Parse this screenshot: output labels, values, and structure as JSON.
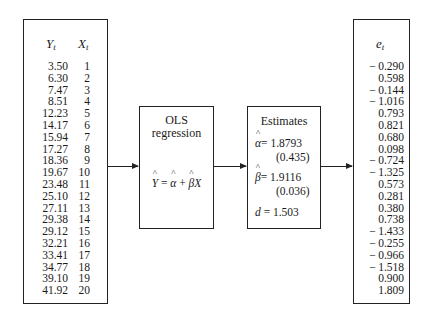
{
  "data_table": {
    "y_header": "Y",
    "y_sub": "t",
    "x_header": "X",
    "x_sub": "t",
    "Y": [
      "3.50",
      "6.30",
      "7.47",
      "8.51",
      "12.23",
      "14.17",
      "15.94",
      "17.27",
      "18.36",
      "19.67",
      "23.48",
      "25.10",
      "27.11",
      "29.38",
      "29.12",
      "32.21",
      "33.41",
      "34.77",
      "39.10",
      "41.92"
    ],
    "X": [
      "1",
      "2",
      "3",
      "4",
      "5",
      "6",
      "7",
      "8",
      "9",
      "10",
      "11",
      "12",
      "13",
      "14",
      "15",
      "16",
      "17",
      "18",
      "19",
      "20"
    ]
  },
  "ols_box": {
    "title_line1": "OLS",
    "title_line2": "regression",
    "equation": {
      "lhs": "Y",
      "eq": " = ",
      "alpha": "α",
      "plus": " + ",
      "beta": "β",
      "x": "X"
    }
  },
  "estimates_box": {
    "title": "Estimates",
    "alpha_symbol": "α",
    "alpha_value": "= 1.8793",
    "alpha_se": "(0.435)",
    "beta_symbol": "β",
    "beta_value": "= 1.9116",
    "beta_se": "(0.036)",
    "d_symbol": "d",
    "d_value": " = 1.503"
  },
  "residuals": {
    "header": "e",
    "sub": "t",
    "values": [
      {
        "neg": true,
        "v": "0.290"
      },
      {
        "neg": false,
        "v": "0.598"
      },
      {
        "neg": true,
        "v": "0.144"
      },
      {
        "neg": true,
        "v": "1.016"
      },
      {
        "neg": false,
        "v": "0.793"
      },
      {
        "neg": false,
        "v": "0.821"
      },
      {
        "neg": false,
        "v": "0.680"
      },
      {
        "neg": false,
        "v": "0.098"
      },
      {
        "neg": true,
        "v": "0.724"
      },
      {
        "neg": true,
        "v": "1.325"
      },
      {
        "neg": false,
        "v": "0.573"
      },
      {
        "neg": false,
        "v": "0.281"
      },
      {
        "neg": false,
        "v": "0.380"
      },
      {
        "neg": false,
        "v": "0.738"
      },
      {
        "neg": true,
        "v": "1.433"
      },
      {
        "neg": true,
        "v": "0.255"
      },
      {
        "neg": true,
        "v": "0.966"
      },
      {
        "neg": true,
        "v": "1.518"
      },
      {
        "neg": false,
        "v": "0.900"
      },
      {
        "neg": false,
        "v": "1.809"
      }
    ]
  }
}
